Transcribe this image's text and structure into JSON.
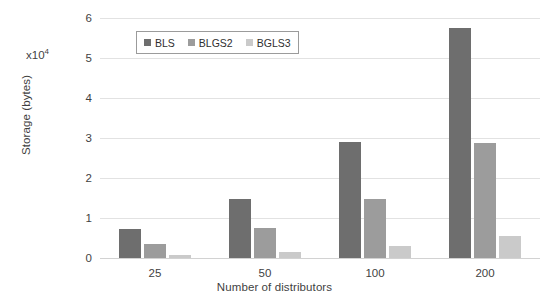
{
  "chart_data": {
    "type": "bar",
    "title": "",
    "xlabel": "Number of distributors",
    "ylabel": "Storage (bytes)",
    "y_multiplier_label": "x10",
    "y_multiplier_exponent": "4",
    "y_multiplier": 10000,
    "categories": [
      "25",
      "50",
      "100",
      "200"
    ],
    "yticks": [
      "0",
      "1",
      "2",
      "3",
      "4",
      "5",
      "6"
    ],
    "ytick_values": [
      0,
      1,
      2,
      3,
      4,
      5,
      6
    ],
    "ylim": [
      0,
      6
    ],
    "grid": true,
    "legend_position": "top-left-inside",
    "series": [
      {
        "name": "BLS",
        "color": "#6e6e6e",
        "values": [
          7300,
          14700,
          28900,
          57500
        ],
        "values_scaled": [
          0.73,
          1.47,
          2.89,
          5.75
        ]
      },
      {
        "name": "BLGS2",
        "color": "#9c9c9c",
        "values": [
          3600,
          7500,
          14800,
          28800
        ],
        "values_scaled": [
          0.36,
          0.75,
          1.48,
          2.88
        ]
      },
      {
        "name": "BGLS3",
        "color": "#cacaca",
        "values": [
          800,
          1500,
          2900,
          5600
        ],
        "values_scaled": [
          0.08,
          0.15,
          0.29,
          0.56
        ]
      }
    ]
  },
  "figure": {
    "background_color": "#ffffff",
    "gridline_color": "#e2e2e2",
    "text_color": "#3f3f3f"
  }
}
